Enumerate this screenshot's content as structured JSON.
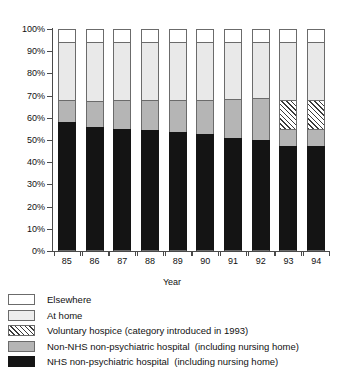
{
  "chart_data": {
    "type": "bar",
    "subtype": "stacked-percentage",
    "title": "",
    "xlabel": "Year",
    "ylabel": "",
    "ylim": [
      0,
      100
    ],
    "yunit": "%",
    "grid": false,
    "legend_position": "below",
    "categories": [
      "85",
      "86",
      "87",
      "88",
      "89",
      "90",
      "91",
      "92",
      "93",
      "94"
    ],
    "ytick_labels": [
      "0%",
      "10%",
      "20%",
      "30%",
      "40%",
      "50%",
      "60%",
      "70%",
      "80%",
      "90%",
      "100%"
    ],
    "ytick_values": [
      0,
      10,
      20,
      30,
      40,
      50,
      60,
      70,
      80,
      90,
      100
    ],
    "series": [
      {
        "name": "NHS non-psychiatric hospital  (including nursing home)",
        "key": "nhs",
        "color": "#141414",
        "values": [
          58.0,
          56.0,
          55.0,
          54.5,
          53.5,
          52.5,
          51.0,
          50.0,
          47.5,
          47.5
        ]
      },
      {
        "name": "Non-NHS non-psychiatric hospital  (including nursing home)",
        "key": "nonnhs",
        "color": "#b5b5b5",
        "values": [
          10.0,
          11.5,
          13.0,
          13.5,
          14.5,
          15.5,
          17.5,
          19.0,
          7.5,
          7.5
        ]
      },
      {
        "name": "Voluntary hospice (category introduced in 1993)",
        "key": "hospice",
        "color": "hatch-diagonal",
        "values": [
          0,
          0,
          0,
          0,
          0,
          0,
          0,
          0,
          13.0,
          13.0
        ]
      },
      {
        "name": "At home",
        "key": "home",
        "color": "#e9e9e9",
        "values": [
          26.0,
          26.5,
          26.0,
          26.0,
          26.0,
          26.0,
          25.5,
          25.0,
          26.0,
          26.0
        ]
      },
      {
        "name": "Elsewhere",
        "key": "else",
        "color": "#ffffff",
        "values": [
          6.0,
          6.0,
          6.0,
          6.0,
          6.0,
          6.0,
          6.0,
          6.0,
          6.0,
          6.0
        ]
      }
    ]
  },
  "axis": {
    "x_title": "Year"
  },
  "legend": {
    "items": [
      {
        "label": "Elsewhere",
        "swatch": "sw-else"
      },
      {
        "label": "At home",
        "swatch": "sw-home"
      },
      {
        "label": "Voluntary hospice (category introduced in 1993)",
        "swatch": "sw-hospice"
      },
      {
        "label": "Non-NHS non-psychiatric hospital  (including nursing home)",
        "swatch": "sw-nonnhs"
      },
      {
        "label": "NHS non-psychiatric hospital  (including nursing home)",
        "swatch": "sw-nhs"
      }
    ]
  }
}
